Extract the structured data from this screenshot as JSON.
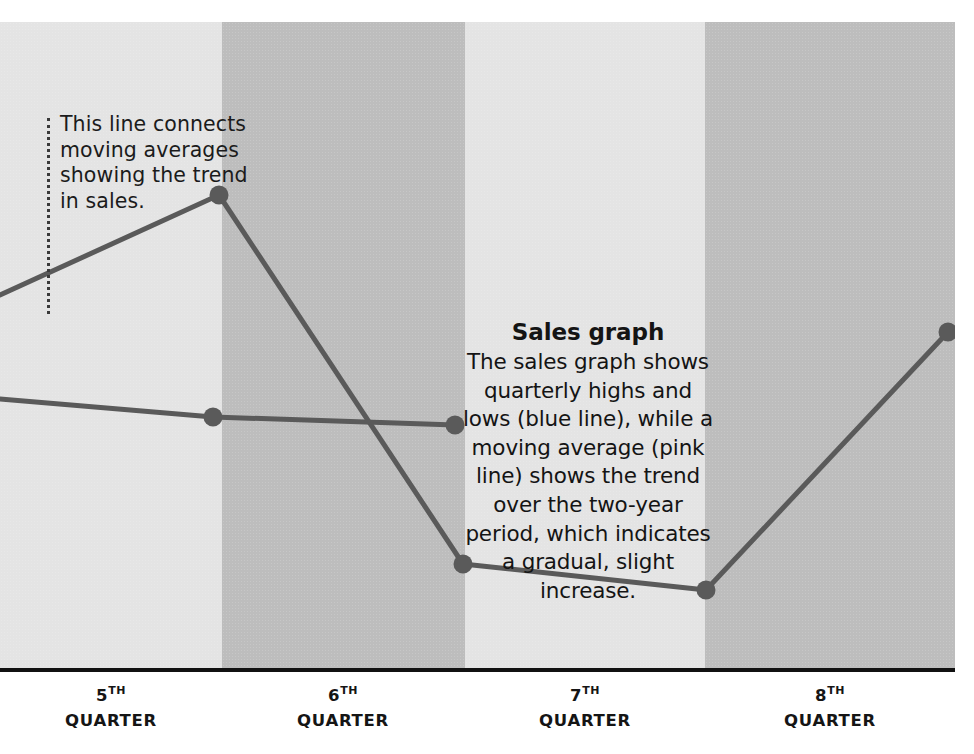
{
  "figure": {
    "kind": "sales-line-graph",
    "background": "#ffffff"
  },
  "callout": {
    "text": "This line connects moving averages showing the trend in sales.",
    "leader_style": "dotted-vertical"
  },
  "annotation": {
    "title": "Sales graph",
    "body": "The sales graph shows quarterly highs and lows (blue line), while a moving average (pink line) shows the trend over the two-year period, which indicates a gradual, slight increase."
  },
  "axis": {
    "ticks": [
      {
        "number": "5",
        "ordinal": "TH",
        "unit": "QUARTER",
        "center_x": 111
      },
      {
        "number": "6",
        "ordinal": "TH",
        "unit": "QUARTER",
        "center_x": 343
      },
      {
        "number": "7",
        "ordinal": "TH",
        "unit": "QUARTER",
        "center_x": 585
      },
      {
        "number": "8",
        "ordinal": "TH",
        "unit": "QUARTER",
        "center_x": 830
      }
    ],
    "line_color": "#111111"
  },
  "bands": [
    {
      "label": "5th quarter band",
      "tone": "light",
      "x": 0,
      "width": 222
    },
    {
      "label": "6th quarter band",
      "tone": "dark",
      "x": 222,
      "width": 243
    },
    {
      "label": "7th quarter band",
      "tone": "light",
      "x": 465,
      "width": 240
    },
    {
      "label": "8th quarter band",
      "tone": "dark",
      "x": 705,
      "width": 250
    }
  ],
  "colors": {
    "band_light": "#e4e4e4",
    "band_dark": "#bdbdbd",
    "series_line": "#5a5a5a",
    "marker_fill": "#5a5a5a",
    "axis": "#111111",
    "text": "#141414"
  },
  "chart_data": {
    "type": "line",
    "title": "Sales graph",
    "xlabel": "",
    "ylabel": "",
    "grid": false,
    "legend": "none",
    "xlim": [
      0,
      955
    ],
    "ylim": [
      648,
      0
    ],
    "categories": [
      "5TH QUARTER",
      "6TH QUARTER",
      "7TH QUARTER",
      "8TH QUARTER"
    ],
    "series": [
      {
        "name": "quarterly highs and lows (blue line)",
        "color": "#5a5a5a",
        "points": [
          {
            "x": 0,
            "y": 375,
            "marker": false
          },
          {
            "x": 219,
            "y": 475,
            "marker": true
          },
          {
            "x": 463,
            "y": 106,
            "marker": true
          },
          {
            "x": 706,
            "y": 80,
            "marker": true
          },
          {
            "x": 948,
            "y": 338,
            "marker": true
          }
        ]
      },
      {
        "name": "moving average (pink line)",
        "color": "#5a5a5a",
        "points": [
          {
            "x": 0,
            "y": 271,
            "marker": false
          },
          {
            "x": 213,
            "y": 253,
            "marker": true
          },
          {
            "x": 455,
            "y": 245,
            "marker": true
          }
        ]
      }
    ],
    "annotations": [
      {
        "name": "moving-average-callout",
        "text": "This line connects moving averages showing the trend in sales."
      },
      {
        "name": "sales-graph-description",
        "text": "The sales graph shows quarterly highs and lows (blue line), while a moving average (pink line) shows the trend over the two-year period, which indicates a gradual, slight increase."
      }
    ]
  }
}
